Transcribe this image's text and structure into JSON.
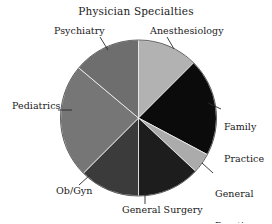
{
  "chart_data": {
    "type": "pie",
    "title": "Physician Specialties",
    "subtitle": "",
    "xlabel": "",
    "ylabel": "",
    "legend_position": "none",
    "grid": false,
    "start_angle_deg": 0,
    "direction": "clockwise",
    "center": {
      "x": 138.5,
      "y": 118
    },
    "radius": 78,
    "categories": [
      "Anesthesiology",
      "Family Practice",
      "General Practice",
      "General Surgery",
      "Ob/Gyn",
      "Pediatrics",
      "Psychiatry"
    ],
    "values": [
      12.5,
      20.3,
      4.2,
      13.1,
      12.5,
      23.6,
      13.8
    ],
    "slices": [
      {
        "label": "Anesthesiology",
        "label_lines": [
          "Anesthesiology"
        ],
        "percent": 12.5,
        "start_deg": 0,
        "end_deg": 45,
        "color": "#b2b2b2"
      },
      {
        "label": "Family Practice",
        "label_lines": [
          "Family",
          "Practice"
        ],
        "percent": 20.3,
        "start_deg": 45,
        "end_deg": 118,
        "color": "#0b0b0b"
      },
      {
        "label": "General Practice",
        "label_lines": [
          "General",
          "Practice"
        ],
        "percent": 4.2,
        "start_deg": 118,
        "end_deg": 133,
        "color": "#ababab"
      },
      {
        "label": "General Surgery",
        "label_lines": [
          "General Surgery"
        ],
        "percent": 13.1,
        "start_deg": 133,
        "end_deg": 180,
        "color": "#1d1d1d"
      },
      {
        "label": "Ob/Gyn",
        "label_lines": [
          "Ob/Gyn"
        ],
        "percent": 12.5,
        "start_deg": 180,
        "end_deg": 225,
        "color": "#3b3b3b"
      },
      {
        "label": "Pediatrics",
        "label_lines": [
          "Pediatrics"
        ],
        "percent": 23.6,
        "start_deg": 225,
        "end_deg": 310,
        "color": "#767676"
      },
      {
        "label": "Psychiatry",
        "label_lines": [
          "Psychiatry"
        ],
        "percent": 13.8,
        "start_deg": 310,
        "end_deg": 360,
        "color": "#6e6e6e"
      }
    ]
  },
  "labels": {
    "anesthesiology": "Anesthesiology",
    "psychiatry": "Psychiatry",
    "family_line1": "Family",
    "family_line2": "Practice",
    "general_practice_line1": "General",
    "general_practice_line2": "Practice",
    "general_surgery": "General Surgery",
    "obgyn": "Ob/Gyn",
    "pediatrics": "Pediatrics"
  },
  "colors": {
    "background": "#ffffff",
    "text": "#1a1a1a",
    "leader_line": "#2a2a2a",
    "slice_border": "#ffffff"
  }
}
